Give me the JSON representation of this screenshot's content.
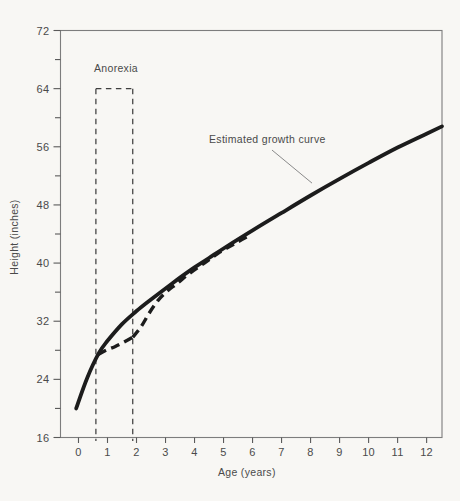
{
  "colors": {
    "background": "#f8f7f4",
    "curve_ink": "#1c1c1c",
    "text": "#4a4a4a",
    "frame": "#7d7d7d",
    "tick": "#5a5a5a",
    "leader": "#8a8a8a",
    "region_dash": "#3f3f3f"
  },
  "chart_data": {
    "type": "line",
    "title": "",
    "xlabel": "Age (years)",
    "ylabel": "Height (inches)",
    "xlim": [
      -0.62,
      12.53
    ],
    "ylim": [
      16,
      72
    ],
    "x_ticks": [
      0,
      1,
      2,
      3,
      4,
      5,
      6,
      7,
      8,
      9,
      10,
      11,
      12
    ],
    "y_ticks_major": [
      16,
      24,
      32,
      40,
      48,
      56,
      64,
      72
    ],
    "y_ticks_minor": [
      20,
      28,
      36,
      44,
      52,
      60,
      68
    ],
    "grid": false,
    "legend_position": "none",
    "series": [
      {
        "name": "Estimated growth curve",
        "style": "solid",
        "x": [
          -0.08,
          0.3,
          0.7,
          1,
          1.5,
          2,
          2.5,
          3,
          3.5,
          4,
          4.5,
          5,
          6,
          7,
          8,
          9,
          10,
          11,
          12,
          12.53
        ],
        "y": [
          20.0,
          24.2,
          27.6,
          29.3,
          31.6,
          33.4,
          35.0,
          36.5,
          38.0,
          39.4,
          40.7,
          42.0,
          44.5,
          46.9,
          49.3,
          51.6,
          53.8,
          55.9,
          57.8,
          58.8
        ]
      },
      {
        "name": "Actual growth during and after anorexia episode",
        "style": "dashed",
        "x": [
          0.68,
          0.95,
          1.25,
          1.55,
          1.87,
          2.15,
          2.45,
          2.75,
          3.05,
          3.4,
          3.8,
          4.3,
          4.8,
          5.35,
          5.9
        ],
        "y": [
          27.4,
          28.0,
          28.5,
          29.1,
          29.8,
          31.2,
          33.2,
          34.9,
          36.1,
          37.2,
          38.5,
          39.9,
          41.3,
          42.6,
          43.8
        ]
      }
    ],
    "annotations": {
      "anorexia_label": "Anorexia",
      "anorexia_region": {
        "x_start": 0.6,
        "x_end": 1.87,
        "y_top": 64
      },
      "curve_label": "Estimated growth curve",
      "leader_line": {
        "from_x": 6.67,
        "from_y": 55.55,
        "to_x": 8.05,
        "to_y": 51.0
      }
    }
  }
}
